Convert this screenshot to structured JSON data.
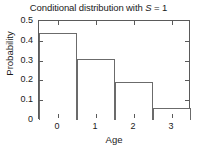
{
  "chart_data": {
    "type": "bar",
    "title": "Conditional distribution with S = 1",
    "title_prefix": "Conditional distribution with ",
    "title_variable": "S",
    "title_suffix": " = 1",
    "categories": [
      "0",
      "1",
      "2",
      "3"
    ],
    "values": [
      0.44,
      0.31,
      0.19,
      0.06
    ],
    "xlabel": "Age",
    "ylabel": "Probability",
    "ylim": [
      0,
      0.5
    ],
    "xlim": [
      -0.5,
      3.5
    ],
    "ytick_labels": [
      "0",
      "0.1",
      "0.2",
      "0.3",
      "0.4",
      "0.5"
    ],
    "ytick_values": [
      0,
      0.1,
      0.2,
      0.3,
      0.4,
      0.5
    ],
    "xtick_labels": [
      "0",
      "1",
      "2",
      "3"
    ],
    "xtick_values": [
      0,
      1,
      2,
      3
    ],
    "grid": false,
    "legend": null,
    "bar_fill": "#ffffff",
    "bar_edge_color": "#6b6b6b",
    "axis_color": "#5a5a5a",
    "text_color": "#1a1a1a",
    "background": "#ffffff"
  }
}
